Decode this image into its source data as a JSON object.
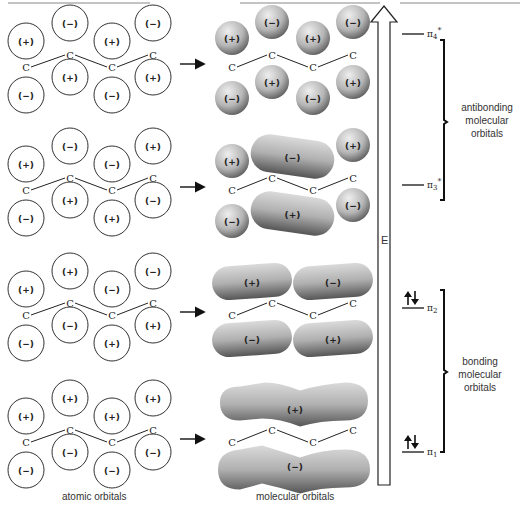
{
  "labels": {
    "atomic": "atomic orbitals",
    "molecular": "molecular orbitals",
    "energy_axis": "E",
    "carbon": "C",
    "antibonding": [
      "antibonding",
      "molecular",
      "orbitals"
    ],
    "bonding": [
      "bonding",
      "molecular",
      "orbitals"
    ]
  },
  "levels": [
    {
      "name": "π4*",
      "base": "π",
      "sub": "4",
      "sup": "*",
      "electrons": 0
    },
    {
      "name": "π3*",
      "base": "π",
      "sub": "3",
      "sup": "*",
      "electrons": 0
    },
    {
      "name": "π2",
      "base": "π",
      "sub": "2",
      "sup": "",
      "electrons": 2
    },
    {
      "name": "π1",
      "base": "π",
      "sub": "1",
      "sup": "",
      "electrons": 2
    }
  ],
  "rows": [
    {
      "level": "π4*",
      "top_signs": [
        "(+)",
        "(−)",
        "(+)",
        "(−)"
      ],
      "bottom_signs": [
        "(−)",
        "(+)",
        "(−)",
        "(+)"
      ],
      "mo_top": [
        "(+)",
        "(−)",
        "(+)",
        "(−)"
      ],
      "mo_bottom": [
        "(−)",
        "(+)",
        "(−)",
        "(+)"
      ]
    },
    {
      "level": "π3*",
      "top_signs": [
        "(+)",
        "(−)",
        "(−)",
        "(+)"
      ],
      "bottom_signs": [
        "(−)",
        "(+)",
        "(+)",
        "(−)"
      ],
      "mo_top": [
        "(+)",
        "(−)",
        "(+)"
      ],
      "mo_bottom": [
        "(−)",
        "(+)",
        "(−)"
      ]
    },
    {
      "level": "π2",
      "top_signs": [
        "(+)",
        "(+)",
        "(−)",
        "(−)"
      ],
      "bottom_signs": [
        "(−)",
        "(−)",
        "(+)",
        "(+)"
      ],
      "mo_top": [
        "(+)",
        "(−)"
      ],
      "mo_bottom": [
        "(−)",
        "(+)"
      ]
    },
    {
      "level": "π1",
      "top_signs": [
        "(+)",
        "(+)",
        "(+)",
        "(+)"
      ],
      "bottom_signs": [
        "(−)",
        "(−)",
        "(−)",
        "(−)"
      ],
      "mo_top": [
        "(+)"
      ],
      "mo_bottom": [
        "(−)"
      ]
    }
  ],
  "colors": {
    "line": "#222222",
    "orbital_light": "#e6e6e6",
    "orbital_dark": "#4a4a4a",
    "node_line": "#888888"
  }
}
